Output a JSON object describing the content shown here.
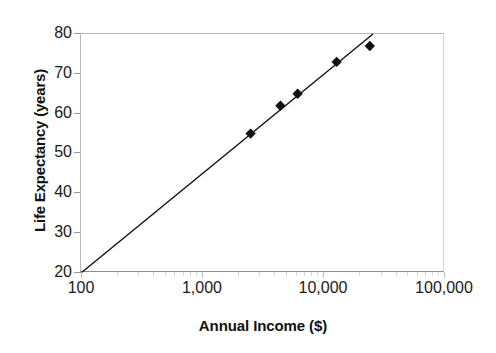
{
  "chart_data": {
    "type": "scatter",
    "title": "",
    "xlabel": "Annual Income ($)",
    "ylabel": "Life Expectancy (years)",
    "x_scale": "log",
    "y_scale": "linear",
    "xlim": [
      100,
      100000
    ],
    "ylim": [
      20,
      80
    ],
    "grid": false,
    "legend": false,
    "x_ticks": [
      {
        "value": 100,
        "label": "100"
      },
      {
        "value": 1000,
        "label": "1,000"
      },
      {
        "value": 10000,
        "label": "10,000"
      },
      {
        "value": 100000,
        "label": "100,000"
      }
    ],
    "y_ticks": [
      {
        "value": 80,
        "label": "80"
      },
      {
        "value": 70,
        "label": "70"
      },
      {
        "value": 60,
        "label": "60"
      },
      {
        "value": 50,
        "label": "50"
      },
      {
        "value": 40,
        "label": "40"
      },
      {
        "value": 30,
        "label": "30"
      },
      {
        "value": 20,
        "label": "20"
      }
    ],
    "series": [
      {
        "name": "observations",
        "marker": "diamond",
        "marker_color": "#111111",
        "points": [
          {
            "x": 2500,
            "y": 55
          },
          {
            "x": 4400,
            "y": 62
          },
          {
            "x": 6100,
            "y": 65
          },
          {
            "x": 12800,
            "y": 73
          },
          {
            "x": 24000,
            "y": 77
          }
        ]
      }
    ],
    "trendline": {
      "name": "fit-line",
      "color": "#111111",
      "from": {
        "x": 100,
        "y": 20
      },
      "to": {
        "x": 25500,
        "y": 80
      }
    }
  },
  "colors": {
    "axis": "#8c8c8c",
    "frame": "#c8c8c8",
    "marker": "#111111",
    "line": "#111111",
    "text": "#1a1a1a",
    "background": "#ffffff"
  }
}
